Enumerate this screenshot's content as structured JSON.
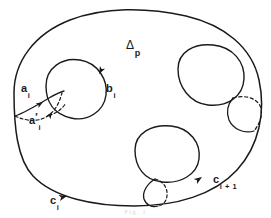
{
  "figure": {
    "domain_kind": "diagram",
    "background_color": "#ffffff",
    "ink_color": "#1a1a1a",
    "width": 271,
    "height": 218,
    "caption": "Fig. 1"
  },
  "labels": {
    "region": {
      "base": "Δ",
      "sub": "p",
      "full": "Δp",
      "x": 126,
      "y": 36
    },
    "a_i": {
      "base": "a",
      "sub": "i",
      "prime": "",
      "full": "ai",
      "x": 21,
      "y": 79
    },
    "a_prime_i": {
      "base": "a",
      "prime": "′",
      "sub": "i",
      "full": "a′i",
      "x": 29,
      "y": 111
    },
    "b_i": {
      "base": "b",
      "sub": "i",
      "full": "bi",
      "x": 106,
      "y": 79
    },
    "c_i": {
      "base": "c",
      "sub": "i",
      "full": "ci",
      "x": 50,
      "y": 191
    },
    "c_i_plus_1": {
      "base": "c",
      "sub": "i + 1",
      "full": "ci + 1",
      "x": 213,
      "y": 170
    }
  },
  "shapes": {
    "outer_boundary": {
      "name": "region-outline",
      "style": "solid",
      "path": "M 14 93 C 14 62 34 34 70 20 C 104 7 146 7 186 16 C 224 25 252 47 259 80 C 266 112 259 146 237 170 C 214 195 176 206 134 206 C 94 206 54 198 33 176 C 17 159 14 126 14 93 Z"
    },
    "hole_left": {
      "name": "hole-left",
      "style": "solid",
      "path": "M 46 86 C 46 68 62 57 80 60 C 98 63 108 80 106 95 C 104 111 88 122 71 118 C 54 114 46 102 46 86 Z"
    },
    "hole_right": {
      "name": "hole-right",
      "style": "solid",
      "path": "M 178 69 C 178 52 194 43 213 45 C 233 47 245 62 244 79 C 243 97 227 107 208 105 C 190 103 178 87 178 69 Z"
    },
    "hole_bottom": {
      "name": "hole-bottom",
      "style": "solid",
      "path": "M 135 150 C 135 133 152 124 171 126 C 190 128 201 143 199 159 C 197 175 180 184 162 182 C 144 180 135 167 135 150 Z"
    },
    "handle_right_solid": {
      "name": "handle-right-front",
      "style": "solid",
      "path": "M 233 98 C 228 104 226 112 229 120 C 233 129 244 134 254 131"
    },
    "handle_right_dashed": {
      "name": "handle-right-back",
      "style": "dashed",
      "path": "M 233 98 C 243 95 254 97 259 104 C 264 111 261 122 254 131"
    },
    "handle_bottom_solid": {
      "name": "handle-bottom-front",
      "style": "solid",
      "path": "M 155 179 C 147 184 142 192 144 199 C 146 205 152 208 158 206"
    },
    "handle_bottom_dashed": {
      "name": "handle-bottom-back",
      "style": "dashed",
      "path": "M 155 179 C 163 181 168 188 167 196 C 166 202 163 205 158 206"
    },
    "arc_a_i": {
      "name": "curve-a-i",
      "style": "solid",
      "path": "M 15 116 C 26 112 39 104 49 98 C 56 94 60 92 64 91"
    },
    "arc_a_prime_i": {
      "name": "curve-a-prime-i",
      "style": "dashed",
      "path": "M 15 116 C 28 122 40 122 49 115 C 57 109 60 100 62 93"
    },
    "arc_a_prime_tail": {
      "name": "curve-a-prime-i-tail",
      "style": "dashed",
      "path": "M 49 115 C 56 114 62 109 66 103"
    }
  },
  "arrowheads": [
    {
      "name": "arrowhead-b-i",
      "on": "hole-left",
      "x": 98,
      "y": 74,
      "angle": 115
    },
    {
      "name": "arrowhead-c-i",
      "on": "region-outline",
      "x": 66,
      "y": 196,
      "angle": -12
    },
    {
      "name": "arrowhead-c-i-plus-1",
      "on": "region-outline",
      "x": 201,
      "y": 177,
      "angle": -32
    },
    {
      "name": "arrowhead-a-i",
      "on": "curve-a-i",
      "x": 41,
      "y": 103,
      "angle": -33
    },
    {
      "name": "arrowhead-a-prime-i",
      "on": "curve-a-prime-i",
      "x": 50,
      "y": 113,
      "angle": -58
    }
  ]
}
